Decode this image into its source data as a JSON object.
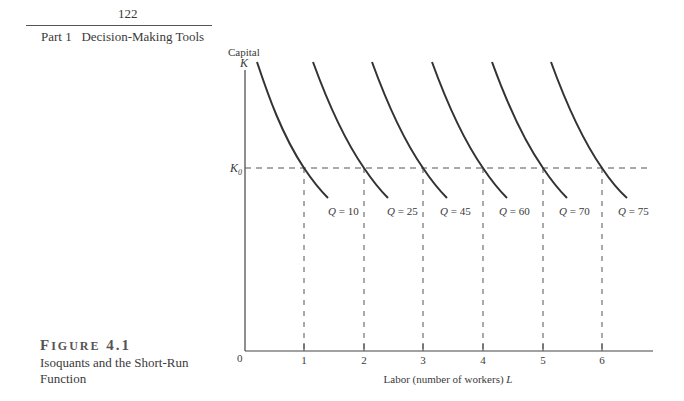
{
  "header": {
    "page_number": "122",
    "section": "Part 1   Decision-Making Tools"
  },
  "figure": {
    "label_first": "F",
    "label_rest": "IGURE",
    "label_number": "4.1",
    "caption": "Isoquants and the Short-Run Function"
  },
  "chart_data": {
    "type": "line",
    "title": "Isoquants and the Short-Run Function",
    "xlabel": "Labor (number of workers) L",
    "ylabel_top": "Capital",
    "ylabel": "K",
    "origin_label": "0",
    "x_ticks": [
      "1",
      "2",
      "3",
      "4",
      "5",
      "6"
    ],
    "horizontal_reference": {
      "label": "K0",
      "style": "dashed"
    },
    "vertical_references": {
      "at": [
        1,
        2,
        3,
        4,
        5,
        6
      ],
      "style": "dashed"
    },
    "series": [
      {
        "name": "Q = 10",
        "crosses_K0_at_L": 1
      },
      {
        "name": "Q = 25",
        "crosses_K0_at_L": 2
      },
      {
        "name": "Q = 45",
        "crosses_K0_at_L": 3
      },
      {
        "name": "Q = 60",
        "crosses_K0_at_L": 4
      },
      {
        "name": "Q = 70",
        "crosses_K0_at_L": 5
      },
      {
        "name": "Q = 75",
        "crosses_K0_at_L": 6
      }
    ],
    "grid": false,
    "legend": "inline labels below curves"
  }
}
